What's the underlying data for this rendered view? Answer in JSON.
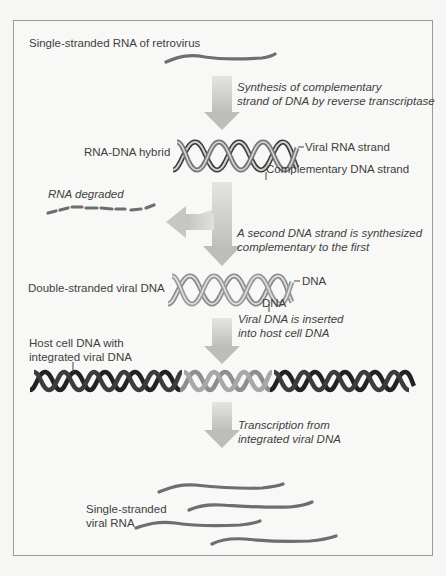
{
  "diagram": {
    "colors": {
      "background": "#f6f6f4",
      "frame_border": "#9a9a9a",
      "text": "#3f3f3f",
      "rna_strand": "#6e6e6e",
      "viral_dna": "#a8a8a8",
      "host_dna": "#2a2a2a",
      "arrow": "#c9c9c9"
    },
    "steps": [
      {
        "id": "ssrna",
        "label": "Single-stranded RNA of retrovirus"
      },
      {
        "id": "step1",
        "process": "Synthesis of complementary strand of DNA by reverse transcriptase",
        "process_lines": [
          "Synthesis of complementary",
          "strand of DNA by reverse transcriptase"
        ]
      },
      {
        "id": "hybrid",
        "label": "RNA-DNA hybrid",
        "annotations": [
          "Viral RNA strand",
          "Complementary DNA strand"
        ]
      },
      {
        "id": "degrade",
        "label": "RNA degraded"
      },
      {
        "id": "step2",
        "process_lines": [
          "A second DNA strand is synthesized",
          "complementary to the first"
        ]
      },
      {
        "id": "dsdna",
        "label": "Double-stranded viral DNA",
        "annotations": [
          "DNA",
          "DNA"
        ]
      },
      {
        "id": "step3",
        "process_lines": [
          "Viral DNA is inserted",
          "into host cell DNA"
        ]
      },
      {
        "id": "host",
        "label_lines": [
          "Host cell DNA with",
          "integrated viral DNA"
        ]
      },
      {
        "id": "step4",
        "process_lines": [
          "Transcription from",
          "integrated viral DNA"
        ]
      },
      {
        "id": "viralrna",
        "label_lines": [
          "Single-stranded",
          "viral RNA"
        ]
      }
    ]
  }
}
